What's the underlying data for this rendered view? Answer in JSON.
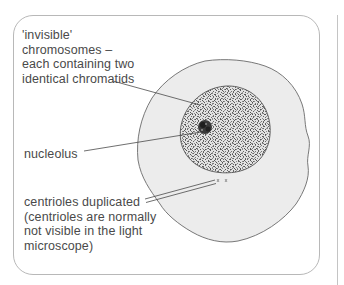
{
  "diagram": {
    "labels": {
      "chromosomes": "'invisible'\nchromosomes –\neach containing two\nidentical chromatids",
      "nucleolus": "nucleolus",
      "centrioles": "centrioles duplicated\n(centrioles are normally\nnot visible in the light\nmicroscope)"
    },
    "structures": [
      {
        "name": "cell-membrane",
        "fill": "#ececec",
        "stroke": "#6a6a6a"
      },
      {
        "name": "nucleus",
        "fill": "#d6d6d6",
        "stroke": "#555555",
        "texture": "stippled"
      },
      {
        "name": "nucleolus",
        "fill": "#2b2b2b"
      },
      {
        "name": "centrioles",
        "count": 2
      }
    ],
    "colors": {
      "text": "#4a4a4a",
      "frame": "#b8b8b8",
      "leader_line": "#4a4a4a"
    }
  }
}
